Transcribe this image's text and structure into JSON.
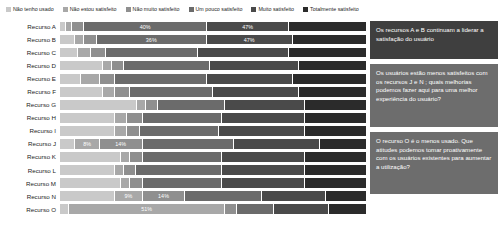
{
  "legend": {
    "items": [
      {
        "label": "Não tenho usado",
        "color": "#c9c9c9"
      },
      {
        "label": "Não estou satisfeito",
        "color": "#a8a8a8"
      },
      {
        "label": "Não muito satisfeito",
        "color": "#8f8f8f"
      },
      {
        "label": "Um pouco satisfeito",
        "color": "#6b6b6b"
      },
      {
        "label": "Muito satisfeito",
        "color": "#4a4a4a"
      },
      {
        "label": "Totalmente satisfeito",
        "color": "#2b2b2b"
      }
    ]
  },
  "callouts": [
    {
      "text": "Os recursos A e B continuam a liderar a satisfação do usuário"
    },
    {
      "text": "Os usuários estão menos satisfeitos com os recursos J e N ; quais melhorias podemos fazer aqui para uma melhor experiência do usuário?"
    },
    {
      "text": "O recurso O é o menos usado. Que atitudes podemos tomar proativamente com os usuários existentes para aumentar a utilização?"
    }
  ],
  "chart_data": {
    "type": "bar",
    "orientation": "horizontal",
    "stacked": true,
    "normalized_percent": true,
    "title": "",
    "xlabel": "",
    "ylabel": "",
    "xlim": [
      0,
      100
    ],
    "grid": false,
    "legend_position": "top",
    "series": [
      {
        "name": "Não tenho usado",
        "color": "#c9c9c9",
        "values": [
          2,
          5,
          6,
          14,
          7,
          14,
          25,
          18,
          18,
          5,
          20,
          18,
          20,
          18,
          3
        ]
      },
      {
        "name": "Não estou satisfeito",
        "color": "#a8a8a8",
        "values": [
          2,
          3,
          4,
          3,
          6,
          4,
          3,
          4,
          4,
          8,
          3,
          3,
          3,
          9,
          51
        ]
      },
      {
        "name": "Não muito satisfeito",
        "color": "#8f8f8f",
        "values": [
          4,
          4,
          5,
          4,
          5,
          5,
          4,
          5,
          4,
          14,
          4,
          4,
          4,
          14,
          4
        ]
      },
      {
        "name": "Um pouco satisfeito",
        "color": "#6b6b6b",
        "values": [
          40,
          36,
          30,
          28,
          30,
          27,
          22,
          26,
          26,
          30,
          26,
          28,
          26,
          25,
          12
        ]
      },
      {
        "name": "Muito satisfeito",
        "color": "#4a4a4a",
        "values": [
          27,
          28,
          30,
          29,
          28,
          28,
          26,
          27,
          28,
          28,
          27,
          27,
          27,
          21,
          18
        ]
      },
      {
        "name": "Totalmente satisfeito",
        "color": "#2b2b2b",
        "values": [
          25,
          24,
          25,
          22,
          24,
          22,
          20,
          20,
          20,
          15,
          20,
          20,
          20,
          13,
          12
        ]
      }
    ],
    "categories": [
      "Recurso A",
      "Recurso B",
      "Recurso C",
      "Recurso D",
      "Recurso E",
      "Recurso F",
      "Recurso G",
      "Recurso H",
      "Recurso I",
      "Recurso J",
      "Recurso K",
      "Recurso L",
      "Recurso M",
      "Recurso N",
      "Recurso O"
    ],
    "data_labels": {
      "Recurso A": {
        "Um pouco satisfeito": "40%",
        "Muito satisfeito": "47%"
      },
      "Recurso B": {
        "Um pouco satisfeito": "36%",
        "Muito satisfeito": "47%"
      },
      "Recurso J": {
        "Não estou satisfeito": "8%",
        "Não muito satisfeito": "14%"
      },
      "Recurso N": {
        "Não estou satisfeito": "9%",
        "Não muito satisfeito": "14%"
      },
      "Recurso O": {
        "Não estou satisfeito": "51%"
      }
    }
  }
}
